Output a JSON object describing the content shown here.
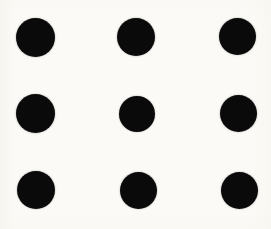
{
  "figure": {
    "width": 271,
    "height": 229,
    "background_color": "#fbfaf6",
    "dot_color": "#0a0a0a",
    "rows": 3,
    "columns": 3,
    "dot_count": 9
  },
  "chart_data": {
    "type": "scatter",
    "xlabel": "",
    "ylabel": "",
    "xlim": [
      0,
      271
    ],
    "ylim": [
      0,
      229
    ],
    "grid": false,
    "legend": "none",
    "marker": "filled-circle",
    "marker_color": "#0a0a0a",
    "background_color": "#fbfaf6",
    "row_centers_y": [
      37,
      113,
      190
    ],
    "column_centers_x": [
      36,
      137,
      238
    ],
    "points": [
      {
        "id": "dot-r1c1",
        "row": 1,
        "column": 1,
        "cx": 35.5,
        "cy": 37.0,
        "diameter": 39
      },
      {
        "id": "dot-r1c2",
        "row": 1,
        "column": 2,
        "cx": 136.0,
        "cy": 37.0,
        "diameter": 38
      },
      {
        "id": "dot-r1c3",
        "row": 1,
        "column": 3,
        "cx": 237.5,
        "cy": 36.5,
        "diameter": 37
      },
      {
        "id": "dot-r2c1",
        "row": 2,
        "column": 1,
        "cx": 35.5,
        "cy": 113.5,
        "diameter": 39
      },
      {
        "id": "dot-r2c2",
        "row": 2,
        "column": 2,
        "cx": 137.0,
        "cy": 113.5,
        "diameter": 36
      },
      {
        "id": "dot-r2c3",
        "row": 2,
        "column": 3,
        "cx": 238.0,
        "cy": 113.0,
        "diameter": 37
      },
      {
        "id": "dot-r3c1",
        "row": 3,
        "column": 1,
        "cx": 36.0,
        "cy": 190.0,
        "diameter": 38
      },
      {
        "id": "dot-r3c2",
        "row": 3,
        "column": 2,
        "cx": 138.0,
        "cy": 190.0,
        "diameter": 37
      },
      {
        "id": "dot-r3c3",
        "row": 3,
        "column": 3,
        "cx": 239.5,
        "cy": 190.0,
        "diameter": 37
      }
    ]
  }
}
